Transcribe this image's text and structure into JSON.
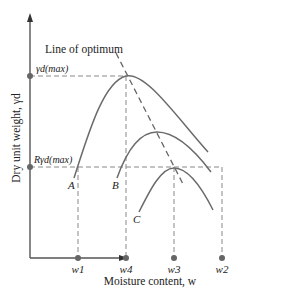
{
  "diagram": {
    "title_annotation": "Line of optimum",
    "y_axis_label": "Dry unit weight, γd",
    "x_axis_label": "Moisture content, w",
    "y_marks": {
      "max": "γd(max)",
      "r_max": "Rγd(max)"
    },
    "x_marks": [
      "w1",
      "w4",
      "w3",
      "w2"
    ],
    "curves": [
      "A",
      "B",
      "C"
    ],
    "colors": {
      "curve": "#6b6b6b",
      "axis": "#555555",
      "dot": "#666666",
      "dash": "#888888"
    }
  }
}
